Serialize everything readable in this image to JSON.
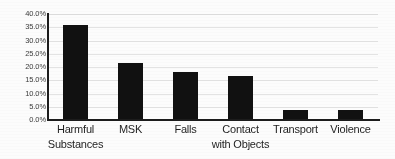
{
  "chart_data": {
    "type": "bar",
    "title": "",
    "subtitle": "",
    "xlabel": "",
    "ylabel": "",
    "categories": [
      "Harmful\nSubstances",
      "MSK",
      "Falls",
      "Contact\nwith Objects",
      "Transport",
      "Violence"
    ],
    "values": [
      36.0,
      21.7,
      18.0,
      16.6,
      3.7,
      3.7
    ],
    "value_labels": [
      "36.0%",
      "21.7%",
      "18.0%",
      "16.6%",
      "3.7%",
      "3.7%"
    ],
    "ylim": [
      0.0,
      40.0
    ],
    "ytick_values": [
      0.0,
      5.0,
      10.0,
      15.0,
      20.0,
      25.0,
      30.0,
      35.0,
      40.0
    ],
    "ytick_labels": [
      "0.0%",
      "5.0%",
      "10.0%",
      "15.0%",
      "20.0%",
      "25.0%",
      "30.0%",
      "35.0%",
      "40.0%"
    ],
    "grid": true,
    "legend": false,
    "legend_position": "none",
    "series": [
      {
        "name": "",
        "values": [
          36.0,
          21.7,
          18.0,
          16.6,
          3.7,
          3.7
        ]
      }
    ],
    "colors": {
      "bar": "#111111",
      "gridline": "#e3e3e3",
      "axis": "#1c1c1c",
      "tick_label": "#3a3a3a",
      "category_label": "#1f1f1f",
      "background": "#fcfcfc"
    }
  }
}
